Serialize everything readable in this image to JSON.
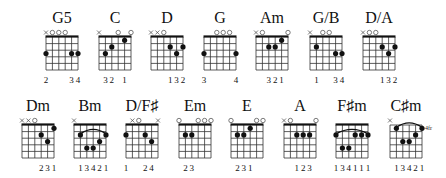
{
  "strings": 6,
  "frets_shown": 5,
  "chords": [
    {
      "name": "G5",
      "row": 0,
      "x": 46,
      "top": [
        "x",
        "o",
        "o",
        "o",
        "",
        ""
      ],
      "dots": [
        [
          1,
          3
        ],
        [
          5,
          3
        ],
        [
          6,
          3
        ]
      ],
      "barre": null,
      "fingers": [
        "2",
        "",
        "",
        "",
        "3",
        "4"
      ],
      "position": ""
    },
    {
      "name": "C",
      "row": 0,
      "x": 99,
      "top": [
        "x",
        "",
        "",
        "o",
        "",
        "o"
      ],
      "dots": [
        [
          2,
          3
        ],
        [
          3,
          2
        ],
        [
          5,
          1
        ]
      ],
      "barre": null,
      "fingers": [
        "",
        "3",
        "2",
        "",
        "1",
        ""
      ],
      "position": ""
    },
    {
      "name": "D",
      "row": 0,
      "x": 151,
      "top": [
        "x",
        "x",
        "o",
        "",
        "",
        ""
      ],
      "dots": [
        [
          4,
          2
        ],
        [
          5,
          3
        ],
        [
          6,
          2
        ]
      ],
      "barre": null,
      "fingers": [
        "",
        "",
        "",
        "1",
        "3",
        "2"
      ],
      "position": ""
    },
    {
      "name": "G",
      "row": 0,
      "x": 204,
      "top": [
        "",
        "",
        "o",
        "o",
        "o",
        ""
      ],
      "dots": [
        [
          1,
          3
        ],
        [
          6,
          3
        ]
      ],
      "barre": null,
      "fingers": [
        "3",
        "",
        "",
        "",
        "",
        "4"
      ],
      "position": ""
    },
    {
      "name": "Am",
      "row": 0,
      "x": 256,
      "top": [
        "x",
        "o",
        "",
        "",
        "",
        "o"
      ],
      "dots": [
        [
          3,
          2
        ],
        [
          4,
          2
        ],
        [
          5,
          1
        ]
      ],
      "barre": null,
      "fingers": [
        "",
        "",
        "3",
        "2",
        "1",
        ""
      ],
      "position": ""
    },
    {
      "name": "G/B",
      "row": 0,
      "x": 310,
      "top": [
        "x",
        "",
        "o",
        "o",
        "",
        ""
      ],
      "dots": [
        [
          2,
          2
        ],
        [
          5,
          3
        ],
        [
          6,
          3
        ]
      ],
      "barre": null,
      "fingers": [
        "",
        "1",
        "",
        "",
        "3",
        "4"
      ],
      "position": ""
    },
    {
      "name": "D/A",
      "row": 0,
      "x": 363,
      "top": [
        "x",
        "o",
        "o",
        "",
        "",
        ""
      ],
      "dots": [
        [
          4,
          2
        ],
        [
          5,
          3
        ],
        [
          6,
          2
        ]
      ],
      "barre": null,
      "fingers": [
        "",
        "",
        "",
        "1",
        "3",
        "2"
      ],
      "position": ""
    },
    {
      "name": "Dm",
      "row": 1,
      "x": 22,
      "top": [
        "x",
        "x",
        "o",
        "",
        "",
        ""
      ],
      "dots": [
        [
          4,
          2
        ],
        [
          5,
          3
        ],
        [
          6,
          1
        ]
      ],
      "barre": null,
      "fingers": [
        "",
        "",
        "",
        "2",
        "3",
        "1"
      ],
      "position": ""
    },
    {
      "name": "Bm",
      "row": 1,
      "x": 74,
      "top": [
        "x",
        "",
        "",
        "",
        "",
        ""
      ],
      "dots": [
        [
          2,
          2
        ],
        [
          3,
          4
        ],
        [
          4,
          4
        ],
        [
          5,
          3
        ],
        [
          6,
          2
        ]
      ],
      "barre": [
        2,
        6,
        2
      ],
      "fingers": [
        "",
        "1",
        "3",
        "4",
        "2",
        "1"
      ],
      "position": ""
    },
    {
      "name": "D/F♯",
      "row": 1,
      "x": 126,
      "top": [
        "",
        "x",
        "o",
        "",
        "",
        "x"
      ],
      "dots": [
        [
          1,
          2
        ],
        [
          4,
          2
        ],
        [
          5,
          3
        ]
      ],
      "barre": null,
      "fingers": [
        "1",
        "",
        "",
        "2",
        "4",
        ""
      ],
      "position": ""
    },
    {
      "name": "Em",
      "row": 1,
      "x": 179,
      "top": [
        "o",
        "",
        "",
        "o",
        "o",
        "o"
      ],
      "dots": [
        [
          2,
          2
        ],
        [
          3,
          2
        ]
      ],
      "barre": null,
      "fingers": [
        "",
        "2",
        "3",
        "",
        "",
        ""
      ],
      "position": ""
    },
    {
      "name": "E",
      "row": 1,
      "x": 231,
      "top": [
        "o",
        "",
        "",
        "",
        "o",
        "o"
      ],
      "dots": [
        [
          2,
          2
        ],
        [
          3,
          2
        ],
        [
          4,
          1
        ]
      ],
      "barre": null,
      "fingers": [
        "",
        "2",
        "3",
        "1",
        "",
        ""
      ],
      "position": ""
    },
    {
      "name": "A",
      "row": 1,
      "x": 284,
      "top": [
        "x",
        "o",
        "",
        "",
        "",
        "o"
      ],
      "dots": [
        [
          3,
          2
        ],
        [
          4,
          2
        ],
        [
          5,
          2
        ]
      ],
      "barre": null,
      "fingers": [
        "",
        "",
        "1",
        "2",
        "3",
        ""
      ],
      "position": ""
    },
    {
      "name": "F♯m",
      "row": 1,
      "x": 336,
      "top": [
        "",
        "",
        "",
        "",
        "",
        ""
      ],
      "dots": [
        [
          1,
          2
        ],
        [
          2,
          4
        ],
        [
          3,
          4
        ],
        [
          4,
          2
        ],
        [
          5,
          2
        ],
        [
          6,
          2
        ]
      ],
      "barre": [
        1,
        6,
        2
      ],
      "fingers": [
        "1",
        "3",
        "4",
        "1",
        "1",
        "1"
      ],
      "position": ""
    },
    {
      "name": "C♯m",
      "row": 1,
      "x": 390,
      "top": [
        "x",
        "",
        "",
        "",
        "",
        ""
      ],
      "dots": [
        [
          2,
          1
        ],
        [
          3,
          3
        ],
        [
          4,
          3
        ],
        [
          5,
          2
        ],
        [
          6,
          1
        ]
      ],
      "barre": [
        2,
        6,
        1
      ],
      "fingers": [
        "",
        "1",
        "3",
        "4",
        "2",
        "1"
      ],
      "position": "4fr"
    }
  ]
}
